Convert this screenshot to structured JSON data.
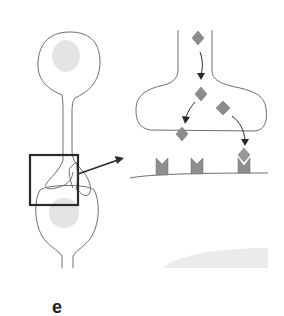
{
  "figure": {
    "panel_label": "e",
    "colors": {
      "outline": "#6e6e6e",
      "nucleus": "#e4e4e4",
      "molecule": "#8c8c8c",
      "receptor": "#8e8e8e",
      "box": "#2a2a2a",
      "arrow": "#2a2a2a",
      "shade": "#ebebeb"
    },
    "elements": {
      "upper_neuron": "presynaptic neuron",
      "lower_neuron": "postsynaptic neuron",
      "inset_box": "synapse region",
      "zoom_terminal": "axon terminal",
      "molecules": [
        "neurotransmitter",
        "neurotransmitter",
        "neurotransmitter",
        "neurotransmitter",
        "neurotransmitter"
      ],
      "receptors": [
        "empty receptor",
        "empty receptor",
        "bound receptor"
      ]
    }
  }
}
